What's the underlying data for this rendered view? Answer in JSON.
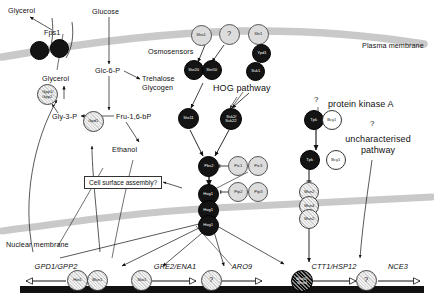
{
  "figure": {
    "type": "pathway-diagram"
  },
  "membranes": {
    "plasma_label": "Plasma membrane",
    "nuclear_label": "Nuclear membrane",
    "color": "#c9c9c9"
  },
  "pathway_labels": {
    "hog": "HOG pathway",
    "pka": "protein kinase A",
    "uncharacterised": "uncharacterised\npathway",
    "uncharacterised_line1": "uncharacterised",
    "uncharacterised_line2": "pathway",
    "osmosensors": "Osmosensors",
    "question1": "?",
    "question2": "?",
    "cell_surface": "Cell surface assembly?"
  },
  "metabolites": {
    "glycerol_out": "Glycerol",
    "glycerol_in": "Glycerol",
    "glucose": "Glucose",
    "glc6p": "Glc-6-P",
    "trehalose": "Trehalose",
    "glycogen": "Glycogen",
    "fru16bp": "Fru-1,6-bP",
    "gly3p": "Gly-3-P",
    "ethanol": "Ethanol"
  },
  "proteins": {
    "fps1": "Fps1",
    "gpp": "Gpp1/\nGpp2",
    "gpp_l1": "Gpp1/",
    "gpp_l2": "Gpp2",
    "gpd1": "Gpd1",
    "sho1": "Sho1",
    "unknown_sensor": "?",
    "sln1": "Sln1",
    "ypd1": "Ypd1",
    "ssk1": "Ssk1",
    "ste20": "Ste20",
    "ste50": "Ste50",
    "ste11": "Ste11",
    "ssk2": "Ssk2/",
    "ssk22": "Ssk22",
    "pbs2": "Pbs2",
    "ptc1": "Ptc1",
    "ptc3": "Ptc3",
    "hog1": "Hog1",
    "ptp2": "Ptp2",
    "ptp3": "Ptp3",
    "tpk": "Tpk",
    "bcy1": "Bcy1",
    "msn2": "Msn2",
    "msn4": "Msn4"
  },
  "genes": [
    {
      "name": "GPD1/GPP2",
      "factors": [
        "Hot1",
        "Msn1"
      ],
      "arrow": "left"
    },
    {
      "name": "GRE2/ENA1",
      "factors": [
        "Sko1"
      ],
      "arrow": "right"
    },
    {
      "name": "ARO9",
      "factors": [
        "?"
      ],
      "arrow": "right"
    },
    {
      "name": "CTT1/HSP12",
      "factors": [
        "Msn2/",
        "Msn4"
      ],
      "arrow": "right"
    },
    {
      "name": "NCE3",
      "factors": [
        "?"
      ],
      "arrow": "right"
    }
  ],
  "colors": {
    "dark_node": "#141414",
    "light_node": "#dcdcdc",
    "membrane": "#c9c9c9",
    "dna": "#111111",
    "text": "#111111"
  }
}
